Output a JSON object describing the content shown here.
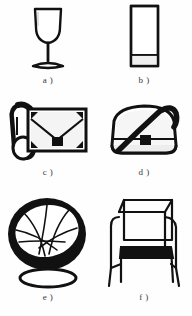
{
  "figure": {
    "style": "black-and-white line drawing catalogue",
    "layout": {
      "columns": 2,
      "rows": 3,
      "total_items": 6
    },
    "background_color": "#fefefe",
    "ink_color": "#111111",
    "fill_color": "#ffffff",
    "shade_color": "#e8e8e8"
  },
  "items": [
    {
      "id": "a",
      "caption": "a )",
      "name": "wine-glass",
      "description": "Stemmed wine glass with rounded bowl, slender stem and flat oval foot",
      "icon": "wine-glass-icon"
    },
    {
      "id": "b",
      "caption": "b )",
      "name": "tumbler-glass",
      "description": "Tall straight-sided tumbler glass with thick rim and banded base",
      "icon": "tumbler-glass-icon"
    },
    {
      "id": "c",
      "caption": "c )",
      "name": "clutch-handbag",
      "description": "Rectangular envelope clutch handbag with V-flap, square clasp and looped side strap",
      "icon": "clutch-handbag-icon"
    },
    {
      "id": "d",
      "caption": "d )",
      "name": "shoulder-bag",
      "description": "Rounded shoulder bag with diagonal strap and square front clasp",
      "icon": "shoulder-bag-icon"
    },
    {
      "id": "e",
      "caption": "e )",
      "name": "pod-swivel-chair",
      "description": "Egg-shaped pod swivel chair with radiating seam panels on a round pedestal base",
      "icon": "pod-chair-icon"
    },
    {
      "id": "f",
      "caption": "f )",
      "name": "frame-armchair",
      "description": "Thin metal frame armchair with rectangular back, dark seat cushion and four legs",
      "icon": "armchair-icon"
    }
  ]
}
